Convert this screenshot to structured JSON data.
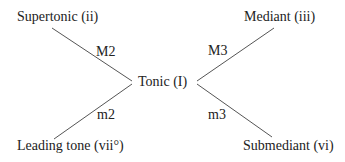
{
  "diagram": {
    "center": {
      "label": "Tonic (I)"
    },
    "nodes": [
      {
        "id": "supertonic",
        "label": "Supertonic (ii)",
        "edge_label": "M2"
      },
      {
        "id": "mediant",
        "label": "Mediant (iii)",
        "edge_label": "M3"
      },
      {
        "id": "leading_tone",
        "label": "Leading tone (vii°)",
        "edge_label": "m2"
      },
      {
        "id": "submediant",
        "label": "Submediant (vi)",
        "edge_label": "m3"
      }
    ],
    "line_color": "#555555"
  }
}
